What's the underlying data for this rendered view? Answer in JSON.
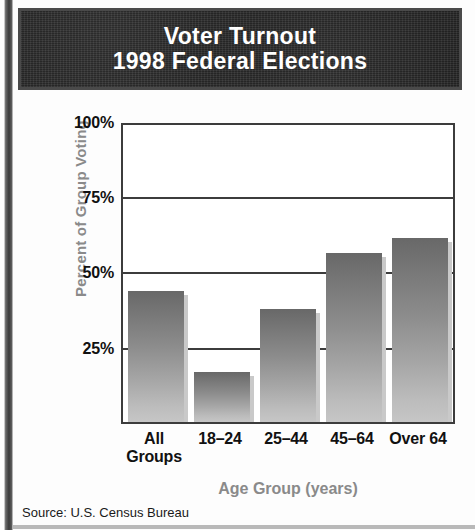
{
  "banner": {
    "line1": "Voter Turnout",
    "line2": "1998 Federal Elections"
  },
  "source": "Source: U.S. Census Bureau",
  "colors": {
    "banner_background": "#262626",
    "banner_text": "#ffffff",
    "bar_top": "#686868",
    "bar_bottom": "#c6c6c6",
    "bar_shadow": "#c9c9c9",
    "axis_line": "#3c3c3c",
    "axis_title": "#8a8a8a",
    "tick_text": "#111111"
  },
  "chart_data": {
    "type": "bar",
    "title": "Voter Turnout 1998 Federal Elections",
    "categories": [
      "All Groups",
      "18–24",
      "25–44",
      "45–64",
      "Over 64"
    ],
    "values": [
      44,
      17,
      38,
      57,
      62
    ],
    "xlabel": "Age Group (years)",
    "ylabel": "Percent of Group Voting",
    "ylim": [
      0,
      100
    ],
    "yticks": [
      25,
      50,
      75,
      100
    ],
    "ytick_labels": [
      "25%",
      "50%",
      "75%",
      "100%"
    ],
    "grid": true,
    "legend": "none",
    "source": "Source: U.S. Census Bureau"
  }
}
